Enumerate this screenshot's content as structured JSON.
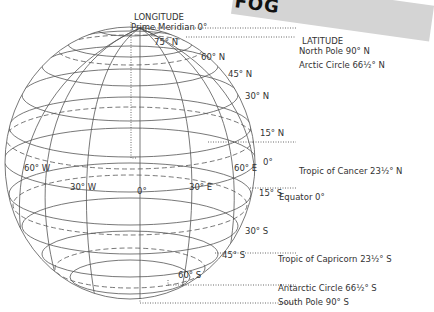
{
  "banner": {
    "text": "FOG"
  },
  "longitude": {
    "header": "LONGITUDE",
    "prime_meridian": "Prime Meridian 0°",
    "labels": [
      "60° W",
      "30° W",
      "0°",
      "30° E",
      "60° E"
    ]
  },
  "latitude": {
    "header": "LATITUDE",
    "callouts": [
      "North Pole 90° N",
      "Arctic Circle 66½° N",
      "Tropic of Cancer 23½° N",
      "Equator 0°",
      "Tropic of Capricorn 23½° S",
      "Antarctic Circle 66½° S",
      "South Pole 90° S"
    ],
    "lines": [
      "75° N",
      "60° N",
      "45° N",
      "30° N",
      "15° N",
      "0°",
      "15° S",
      "30° S",
      "45° S",
      "60° S"
    ]
  },
  "colors": {
    "line": "#555555",
    "banner": "#d4d4d4"
  }
}
